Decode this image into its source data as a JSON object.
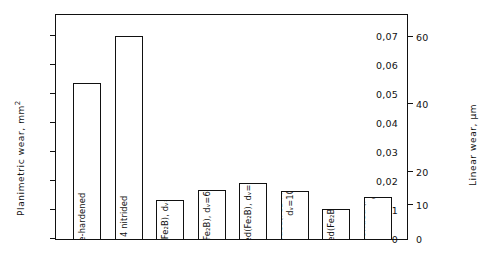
{
  "chart_data": {
    "type": "bar",
    "title": "",
    "xlabel": "",
    "ylabel": "Planimetric wear, mm 2",
    "ylabel_right": "Linear wear, µm",
    "ylim": [
      0,
      0.078
    ],
    "ylim_right": [
      0,
      67
    ],
    "grid": false,
    "legend": "none",
    "yticks": [
      "0",
      "0,01",
      "0,02",
      "0,03",
      "0,04",
      "0,05",
      "0,06",
      "0,07"
    ],
    "ytick_values": [
      0,
      0.01,
      0.02,
      0.03,
      0.04,
      0.05,
      0.06,
      0.07
    ],
    "yticks_right": [
      "0",
      "10",
      "20",
      "40",
      "60"
    ],
    "ytick_values_right": [
      0,
      10,
      20,
      40,
      60
    ],
    "categories": [
      "C 45 case-hardened",
      "42 CrMo 4  nitrided",
      "C 45 borided (Fe2B), dv=36µm",
      "C 45 borided(Fe2B), dv=64µm",
      "42 CrMo 4 borided(Fe2B), dv=56µm",
      "42 CrMo 4 borided(FeB+Fe2B), dv=101µm",
      "X 20 Cr 13 borided(Fe2B), dv=40µm",
      "X 38 CrMoV 5.1 borided (FeB+Fe2B) dv=55µm"
    ],
    "values": [
      0.054,
      0.07,
      0.0135,
      0.017,
      0.0195,
      0.0165,
      0.0105,
      0.0145
    ]
  },
  "bars": [
    {
      "line1": "C 45 case-hardened",
      "line2": "",
      "value": 0.054,
      "name": "bar-c45-case-hardened"
    },
    {
      "line1": "42 CrMo 4  nitrided",
      "line2": "",
      "value": 0.07,
      "name": "bar-42crmo4-nitrided"
    },
    {
      "line1": "C 45 borided (Fe₂B), dᵥ=36µm",
      "line2": "",
      "value": 0.0135,
      "name": "bar-c45-borided-fe2b-36"
    },
    {
      "line1": "C 45 borided(Fe₂B), dᵥ=64µm",
      "line2": "",
      "value": 0.017,
      "name": "bar-c45-borided-fe2b-64"
    },
    {
      "line1": "42 CrMo 4 borided(Fe₂B), dᵥ=56µm",
      "line2": "",
      "value": 0.0195,
      "name": "bar-42crmo4-borided-fe2b-56"
    },
    {
      "line1": "42 CrMo 4 borided(FeB+Fe₂B),",
      "line2": "dᵥ=101µm",
      "value": 0.0165,
      "name": "bar-42crmo4-borided-feb-fe2b-101"
    },
    {
      "line1": "X 20 Cr 13 borided(Fe₂B), dᵥ=40µm",
      "line2": "",
      "value": 0.0105,
      "name": "bar-x20cr13-borided-fe2b-40"
    },
    {
      "line1": "X 38 CrMoV 5.1 borided (FeB+Fe₂B)",
      "line2": "dᵥ=55µm",
      "value": 0.0145,
      "name": "bar-x38crmov51-borided-feb-fe2b-55"
    }
  ],
  "axes": {
    "left_title_main": "Planimetric wear, mm",
    "left_title_sup": "2",
    "right_title": "Linear wear, µm"
  },
  "colors": {
    "foreground": "#111111",
    "background": "#ffffff",
    "bar_fill": "#ffffff",
    "bar_stroke": "#111111"
  }
}
